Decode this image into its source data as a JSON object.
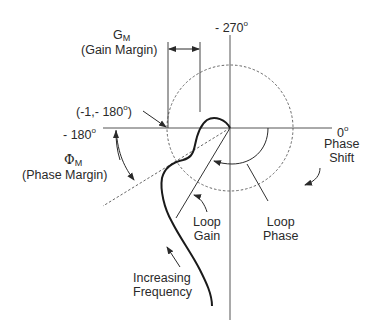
{
  "diagram": {
    "axes": {
      "top_label": "- 270",
      "left_label": "- 180",
      "right_label": "0",
      "degree_symbol": "o"
    },
    "gain_margin": {
      "symbol": "G",
      "subscript": "M",
      "description": "(Gain Margin)"
    },
    "phase_margin": {
      "symbol": "Φ",
      "subscript": "M",
      "description": "(Phase Margin)"
    },
    "critical_point": {
      "label_prefix": "(-1,- 180",
      "label_suffix": ")"
    },
    "phase_shift": {
      "line1": "Phase",
      "line2": "Shift"
    },
    "loop_gain": {
      "line1": "Loop",
      "line2": "Gain"
    },
    "loop_phase": {
      "line1": "Loop",
      "line2": "Phase"
    },
    "frequency": {
      "line1": "Increasing",
      "line2": "Frequency"
    },
    "colors": {
      "line": "#3a3a3a",
      "curve": "#1a1a1a",
      "background": "#ffffff"
    }
  }
}
